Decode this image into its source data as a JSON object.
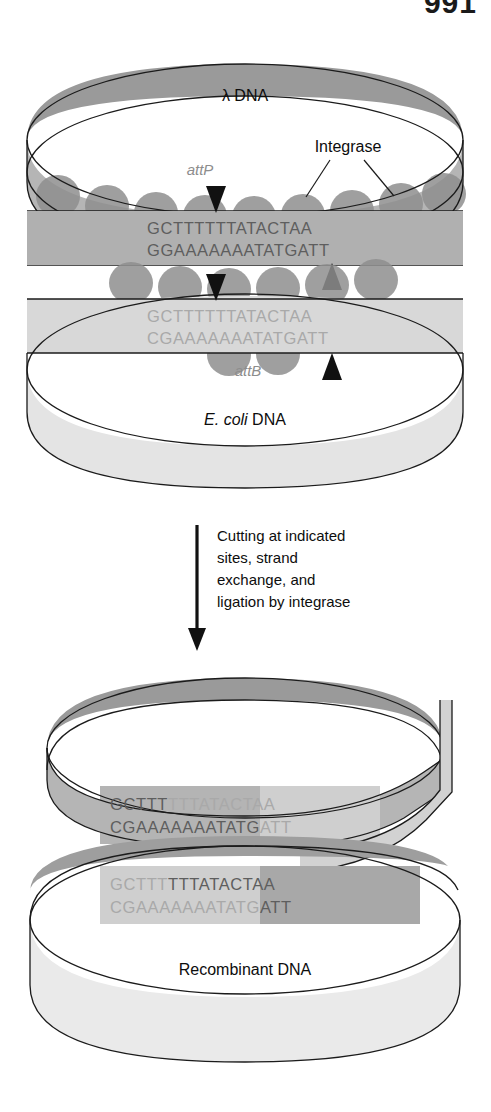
{
  "page": {
    "number": "991"
  },
  "figure": {
    "title_top": "λ DNA",
    "title_bottom": "E. coli DNA",
    "ecoli_italic": "E. coli",
    "ecoli_plain": " DNA",
    "recombinant_label": "Recombinant DNA",
    "integrase_label": "Integrase",
    "attp_label": "attP",
    "attb_label": "attB"
  },
  "sequences": {
    "lambda_top_strand": "GCTTTTTTATACTAA",
    "lambda_bottom_strand": "GGAAAAAAATATGATT",
    "ecoli_top_strand": "GCTTTTTTATACTAA",
    "ecoli_bottom_strand": "CGAAAAAAATATGATT",
    "recombinant_1_top": "GCTTTTTTATACTAA",
    "recombinant_1_bottom": "CGAAAAAAATATGATT",
    "recombinant_2_top": "GCTTTTTTATACTAA",
    "recombinant_2_bottom": "CGAAAAAAATATGATT",
    "recombinant_1_top_prefix": "GCTTT",
    "recombinant_1_top_suffix": "TTTATACTAA",
    "recombinant_1_bottom_prefix": "CGAAAAAAATATG",
    "recombinant_1_bottom_suffix": "ATT",
    "recombinant_2_top_prefix": "GCTTT",
    "recombinant_2_top_suffix": "TTTATACTAA",
    "recombinant_2_bottom_prefix": "CGAAAAAAATATG",
    "recombinant_2_bottom_suffix": "ATT"
  },
  "arrow_caption": {
    "line1": "Cutting at indicated",
    "line2": "sites, strand",
    "line3": "exchange, and",
    "line4": "ligation by integrase"
  },
  "markers": {
    "cut_site_count": 4,
    "integrase_blob_count_lambda": 9,
    "integrase_blob_count_ecoli": 8
  },
  "colors": {
    "lambda_band_dark": "#9a9a9a",
    "lambda_band_mid": "#b3b3b3",
    "ecoli_band_light": "#dcdcdc",
    "ecoli_band_lighter": "#e9e9e9",
    "integrase_blob": "#8f8f8f",
    "outline": "#1b1b1b",
    "sequence_dark": "#5e5e5e",
    "sequence_light": "#a9a9a9",
    "att_label": "#8d8d8d",
    "text": "#0d0d0d",
    "background": "#ffffff"
  }
}
